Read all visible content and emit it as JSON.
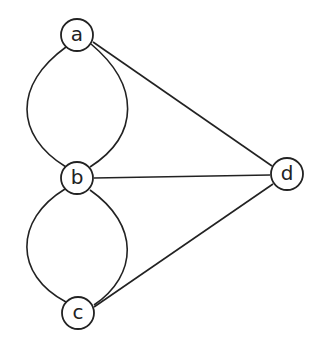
{
  "diagram": {
    "type": "multigraph",
    "nodes": [
      {
        "id": "a",
        "label": "a",
        "x": 77,
        "y": 35
      },
      {
        "id": "b",
        "label": "b",
        "x": 77,
        "y": 178
      },
      {
        "id": "c",
        "label": "c",
        "x": 78,
        "y": 313
      },
      {
        "id": "d",
        "label": "d",
        "x": 287,
        "y": 174
      }
    ],
    "edges": [
      {
        "from": "a",
        "to": "b",
        "shape": "arc-left"
      },
      {
        "from": "a",
        "to": "b",
        "shape": "arc-right"
      },
      {
        "from": "b",
        "to": "c",
        "shape": "arc-left"
      },
      {
        "from": "b",
        "to": "c",
        "shape": "arc-right"
      },
      {
        "from": "a",
        "to": "d",
        "shape": "line"
      },
      {
        "from": "b",
        "to": "d",
        "shape": "line"
      },
      {
        "from": "c",
        "to": "d",
        "shape": "line"
      }
    ]
  }
}
